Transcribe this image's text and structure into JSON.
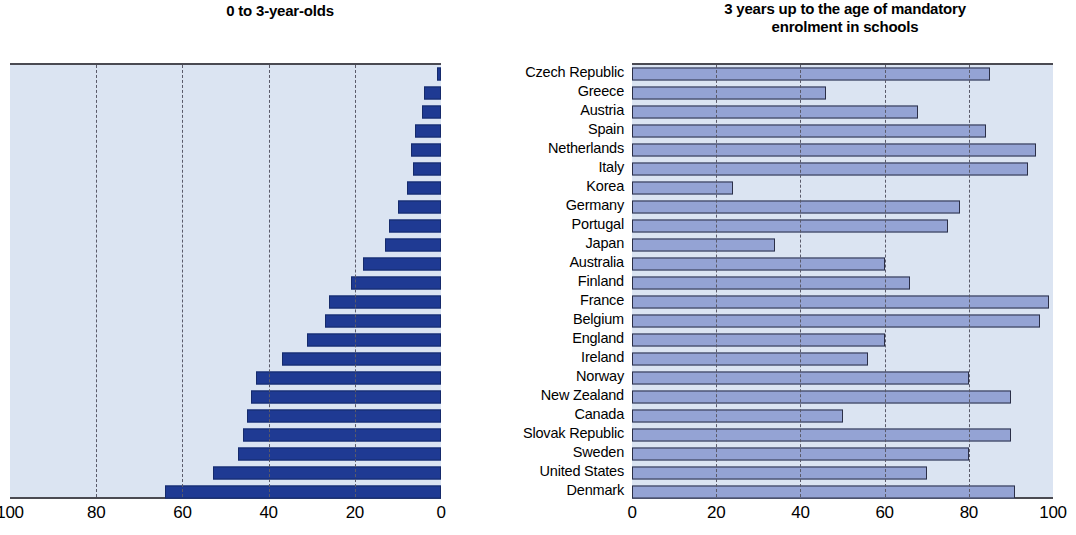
{
  "titles": {
    "left": "0 to 3-year-olds",
    "right_line1": "3 years up to the age of mandatory",
    "right_line2": "enrolment in schools"
  },
  "colors": {
    "plot_background": "#dbe4f2",
    "left_bar": "#1f3a93",
    "right_bar": "#94a3d4",
    "axis_line": "#4a4a52",
    "gridline": "#5a5a6a"
  },
  "chart_data": {
    "type": "bar",
    "orientation": "horizontal",
    "categories": [
      "Czech Republic",
      "Greece",
      "Austria",
      "Spain",
      "Netherlands",
      "Italy",
      "Korea",
      "Germany",
      "Portugal",
      "Japan",
      "Australia",
      "Finland",
      "France",
      "Belgium",
      "England",
      "Ireland",
      "Norway",
      "New Zealand",
      "Canada",
      "Slovak Republic",
      "Sweden",
      "United States",
      "Denmark"
    ],
    "series": [
      {
        "name": "0 to 3-year-olds",
        "panel": "left",
        "direction": "right-to-left",
        "xlabel": "",
        "ylabel": "",
        "xlim": [
          100,
          0
        ],
        "xticks": [
          100,
          80,
          60,
          40,
          20,
          0
        ],
        "grid": true,
        "values": [
          1,
          4,
          4.5,
          6,
          7,
          6.5,
          8,
          10,
          12,
          13,
          18,
          21,
          26,
          27,
          31,
          37,
          43,
          44,
          45,
          46,
          47,
          53,
          64
        ]
      },
      {
        "name": "3 years up to the age of mandatory enrolment in schools",
        "panel": "right",
        "direction": "left-to-right",
        "xlabel": "",
        "ylabel": "",
        "xlim": [
          0,
          100
        ],
        "xticks": [
          0,
          20,
          40,
          60,
          80,
          100
        ],
        "grid": true,
        "values": [
          85,
          46,
          68,
          84,
          96,
          94,
          24,
          78,
          75,
          34,
          60,
          66,
          99,
          97,
          60,
          56,
          80,
          90,
          50,
          90,
          80,
          70,
          91
        ]
      }
    ]
  }
}
